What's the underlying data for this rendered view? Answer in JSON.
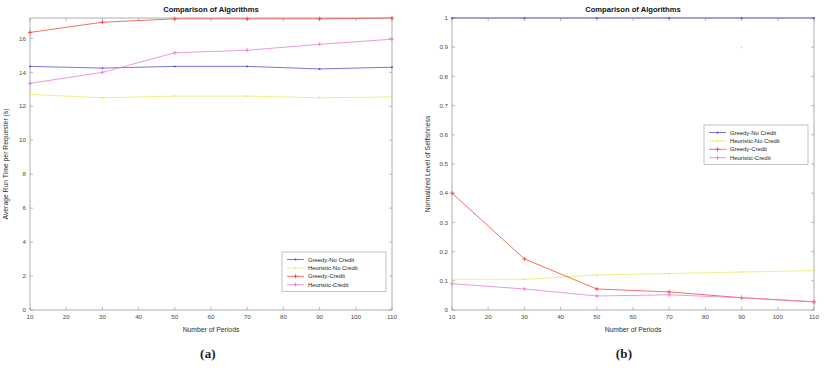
{
  "figure": {
    "panels": [
      {
        "id": "panel-a",
        "caption": "(a)",
        "chart_data": {
          "type": "line",
          "title": "Comparison of Algorithms",
          "xlabel": "Number of Periods",
          "ylabel": "Average Run Time per Requester (s)",
          "xlim": [
            10,
            110
          ],
          "ylim": [
            0,
            17.2
          ],
          "xticks": [
            10,
            20,
            30,
            40,
            50,
            60,
            70,
            80,
            90,
            100,
            110
          ],
          "yticks": [
            0,
            2,
            4,
            6,
            8,
            10,
            12,
            14,
            16
          ],
          "grid": false,
          "legend_position": "lower-right",
          "x": [
            10,
            30,
            50,
            70,
            90,
            110
          ],
          "series": [
            {
              "name": "Greedy-No Credit",
              "color": "#4a4ad0",
              "marker": "dot",
              "values": [
                14.35,
                14.25,
                14.35,
                14.35,
                14.2,
                14.3
              ]
            },
            {
              "name": "Heuristic-No Credit",
              "color": "#e8e85c",
              "marker": "dot",
              "values": [
                12.7,
                12.5,
                12.6,
                12.6,
                12.5,
                12.55
              ]
            },
            {
              "name": "Greedy-Credit",
              "color": "#ef4136",
              "marker": "plus",
              "values": [
                16.35,
                16.95,
                17.15,
                17.15,
                17.15,
                17.2
              ]
            },
            {
              "name": "Heuristic-Credit",
              "color": "#e87ad0",
              "marker": "plus",
              "values": [
                13.35,
                14.0,
                15.15,
                15.3,
                15.65,
                15.95
              ]
            }
          ]
        }
      },
      {
        "id": "panel-b",
        "caption": "(b)",
        "chart_data": {
          "type": "line",
          "title": "Comparison of Algorithms",
          "xlabel": "Number of Periods",
          "ylabel": "Normalized Level of Selfishness",
          "xlim": [
            10,
            110
          ],
          "ylim": [
            0,
            1
          ],
          "xticks": [
            10,
            20,
            30,
            40,
            50,
            60,
            70,
            80,
            90,
            100,
            110
          ],
          "yticks": [
            0,
            0.1,
            0.2,
            0.3,
            0.4,
            0.5,
            0.6,
            0.7,
            0.8,
            0.9,
            1
          ],
          "ytick_labels": [
            "0",
            "0.1",
            "0.2",
            "0.3",
            "0.4",
            "0.5",
            "0.6",
            "0.7",
            "0.8",
            "0.9",
            "1"
          ],
          "grid": false,
          "legend_position": "middle-right",
          "x": [
            10,
            30,
            50,
            70,
            90,
            110
          ],
          "series": [
            {
              "name": "Greedy-No Credit",
              "color": "#4a4ad0",
              "marker": "dot",
              "values": [
                1,
                1,
                1,
                1,
                1,
                1
              ]
            },
            {
              "name": "Heuristic-No Credit",
              "color": "#e8e85c",
              "marker": "dot",
              "values": [
                0.105,
                0.105,
                0.12,
                0.125,
                0.13,
                0.135
              ]
            },
            {
              "name": "Greedy-Credit",
              "color": "#ef4136",
              "marker": "plus",
              "values": [
                0.4,
                0.175,
                0.072,
                0.062,
                0.042,
                0.028
              ]
            },
            {
              "name": "Heuristic-Credit",
              "color": "#e87ad0",
              "marker": "plus",
              "values": [
                0.09,
                0.072,
                0.048,
                0.052,
                0.042,
                0.028
              ]
            }
          ],
          "annotations": [
            {
              "name": "heuristic-no-credit-outlier",
              "x": 90,
              "y": 0.9,
              "color": "#e8e85c",
              "marker": "dot"
            }
          ]
        }
      }
    ]
  }
}
